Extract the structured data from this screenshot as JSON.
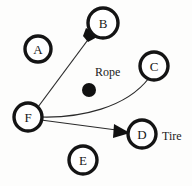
{
  "diagram": {
    "background_color": "#fdfdfc",
    "stroke_color": "#141414",
    "edge_color": "#2b2b2b",
    "nodes": [
      {
        "id": "A",
        "label": "A",
        "cx": 38,
        "cy": 49,
        "r": 13
      },
      {
        "id": "B",
        "label": "B",
        "cx": 103,
        "cy": 23,
        "r": 15
      },
      {
        "id": "C",
        "label": "C",
        "cx": 154,
        "cy": 66,
        "r": 14
      },
      {
        "id": "D",
        "label": "D",
        "cx": 142,
        "cy": 134,
        "r": 14
      },
      {
        "id": "E",
        "label": "E",
        "cx": 83,
        "cy": 160,
        "r": 14
      },
      {
        "id": "F",
        "label": "F",
        "cx": 28,
        "cy": 117,
        "r": 14
      }
    ],
    "edges": [
      {
        "id": "F-to-B",
        "from": "F",
        "to": "B",
        "style": "straight",
        "arrow": true
      },
      {
        "id": "F-to-C",
        "from": "F",
        "to": "C",
        "style": "curved",
        "arrow": false
      },
      {
        "id": "F-to-D",
        "from": "F",
        "to": "D",
        "style": "straight",
        "arrow": true
      }
    ],
    "annotations": [
      {
        "id": "rope-label",
        "text": "Rope",
        "x": 95,
        "y": 72
      },
      {
        "id": "tire-label",
        "text": "Tire",
        "x": 162,
        "y": 136
      }
    ],
    "blob": {
      "id": "rope-blob",
      "cx": 89,
      "cy": 90,
      "r": 7,
      "color": "#111111"
    }
  }
}
